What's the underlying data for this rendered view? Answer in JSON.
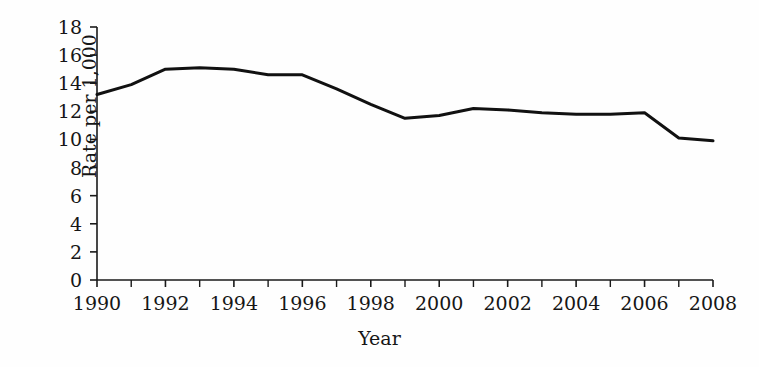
{
  "chart_data": {
    "type": "line",
    "title": "",
    "xlabel": "Year",
    "ylabel": "Rate per 1,000",
    "x": [
      1990,
      1991,
      1992,
      1993,
      1994,
      1995,
      1996,
      1997,
      1998,
      1999,
      2000,
      2001,
      2002,
      2003,
      2004,
      2005,
      2006,
      2007,
      2008
    ],
    "values": [
      13.2,
      13.9,
      15.0,
      15.1,
      15.0,
      14.6,
      14.6,
      13.6,
      12.5,
      11.5,
      11.7,
      12.2,
      12.1,
      11.9,
      11.8,
      11.8,
      11.9,
      10.1,
      9.9
    ],
    "series": [
      {
        "name": "Rate per 1,000",
        "color": "#111111",
        "values": [
          13.2,
          13.9,
          15.0,
          15.1,
          15.0,
          14.6,
          14.6,
          13.6,
          12.5,
          11.5,
          11.7,
          12.2,
          12.1,
          11.9,
          11.8,
          11.8,
          11.9,
          10.1,
          9.9
        ]
      }
    ],
    "xlim": [
      1990,
      2008
    ],
    "ylim": [
      0,
      18
    ],
    "ytick_values": [
      0,
      2,
      4,
      6,
      8,
      10,
      12,
      14,
      16,
      18
    ],
    "ytick_labels": [
      "0",
      "2",
      "4",
      "6",
      "8",
      "10",
      "12",
      "14",
      "16",
      "18"
    ],
    "xtick_values": [
      1990,
      1992,
      1994,
      1996,
      1998,
      2000,
      2002,
      2004,
      2006,
      2008
    ],
    "xtick_labels": [
      "1990",
      "1992",
      "1994",
      "1996",
      "1998",
      "2000",
      "2002",
      "2004",
      "2006",
      "2008"
    ],
    "xtick_minor_values": [
      1991,
      1993,
      1995,
      1997,
      1999,
      2001,
      2003,
      2005,
      2007
    ],
    "grid": false,
    "legend": null,
    "legend_position": "none",
    "annotations": []
  },
  "figure": {
    "background_color": "#ffffff",
    "axis_color": "#1a1a1a",
    "line_color": "#111111",
    "line_width_px": 3
  }
}
